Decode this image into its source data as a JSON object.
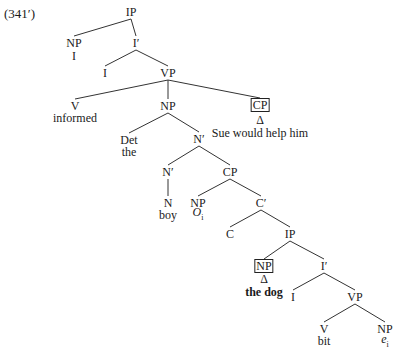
{
  "example_number": "(341′)",
  "tree": {
    "nodes": [
      {
        "id": "ip1",
        "label": "IP",
        "x": 131,
        "y": 12
      },
      {
        "id": "np1",
        "label": "NP",
        "x": 74,
        "y": 43
      },
      {
        "id": "np1w",
        "label": "I",
        "x": 74,
        "y": 56,
        "word": true
      },
      {
        "id": "ib1",
        "label": "I′",
        "x": 136,
        "y": 43
      },
      {
        "id": "i1",
        "label": "I",
        "x": 105,
        "y": 73
      },
      {
        "id": "vp1",
        "label": "VP",
        "x": 168,
        "y": 73
      },
      {
        "id": "v1",
        "label": "V",
        "x": 75,
        "y": 106
      },
      {
        "id": "v1w",
        "label": "informed",
        "x": 75,
        "y": 118,
        "word": true
      },
      {
        "id": "np2",
        "label": "NP",
        "x": 168,
        "y": 106
      },
      {
        "id": "cp1",
        "label": "CP",
        "x": 260,
        "y": 105,
        "boxed": true
      },
      {
        "id": "cp1d",
        "label": "Δ",
        "x": 260,
        "y": 120,
        "word": true
      },
      {
        "id": "cp1w",
        "label": "Sue would help him",
        "x": 260,
        "y": 133,
        "word": true
      },
      {
        "id": "det",
        "label": "Det",
        "x": 129,
        "y": 140
      },
      {
        "id": "detw",
        "label": "the",
        "x": 129,
        "y": 152,
        "word": true
      },
      {
        "id": "nb1",
        "label": "N′",
        "x": 199,
        "y": 139
      },
      {
        "id": "nb2",
        "label": "N′",
        "x": 168,
        "y": 172
      },
      {
        "id": "cp2",
        "label": "CP",
        "x": 230,
        "y": 172
      },
      {
        "id": "n",
        "label": "N",
        "x": 168,
        "y": 203
      },
      {
        "id": "nw",
        "label": "boy",
        "x": 168,
        "y": 215,
        "word": true
      },
      {
        "id": "np3",
        "label": "NP",
        "x": 198,
        "y": 203
      },
      {
        "id": "np3w",
        "label": "O",
        "sub": "i",
        "x": 198,
        "y": 215,
        "word": true,
        "italic": true
      },
      {
        "id": "cb",
        "label": "C′",
        "x": 261,
        "y": 203
      },
      {
        "id": "c",
        "label": "C",
        "x": 230,
        "y": 234
      },
      {
        "id": "ip2",
        "label": "IP",
        "x": 290,
        "y": 234
      },
      {
        "id": "np4",
        "label": "NP",
        "x": 264,
        "y": 266,
        "boxed": true
      },
      {
        "id": "np4d",
        "label": "Δ",
        "x": 264,
        "y": 279,
        "word": true
      },
      {
        "id": "np4w",
        "label": "the dog",
        "x": 264,
        "y": 292,
        "word": true,
        "bold": true
      },
      {
        "id": "ib2",
        "label": "I′",
        "x": 324,
        "y": 266
      },
      {
        "id": "i2",
        "label": "I",
        "x": 293,
        "y": 297
      },
      {
        "id": "vp2",
        "label": "VP",
        "x": 355,
        "y": 297
      },
      {
        "id": "v2",
        "label": "V",
        "x": 324,
        "y": 329
      },
      {
        "id": "v2w",
        "label": "bit",
        "x": 324,
        "y": 341,
        "word": true
      },
      {
        "id": "np5",
        "label": "NP",
        "x": 385,
        "y": 329
      },
      {
        "id": "np5w",
        "label": "e",
        "sub": "i",
        "x": 385,
        "y": 342,
        "word": true,
        "italic": true
      }
    ],
    "edges": [
      [
        "ip1",
        "np1"
      ],
      [
        "ip1",
        "ib1"
      ],
      [
        "ib1",
        "i1"
      ],
      [
        "ib1",
        "vp1"
      ],
      [
        "vp1",
        "v1"
      ],
      [
        "vp1",
        "np2"
      ],
      [
        "vp1",
        "cp1"
      ],
      [
        "np2",
        "det"
      ],
      [
        "np2",
        "nb1"
      ],
      [
        "nb1",
        "nb2"
      ],
      [
        "nb1",
        "cp2"
      ],
      [
        "nb2",
        "n"
      ],
      [
        "cp2",
        "np3"
      ],
      [
        "cp2",
        "cb"
      ],
      [
        "cb",
        "c"
      ],
      [
        "cb",
        "ip2"
      ],
      [
        "ip2",
        "np4"
      ],
      [
        "ip2",
        "ib2"
      ],
      [
        "ib2",
        "i2"
      ],
      [
        "ib2",
        "vp2"
      ],
      [
        "vp2",
        "v2"
      ],
      [
        "vp2",
        "np5"
      ]
    ]
  }
}
